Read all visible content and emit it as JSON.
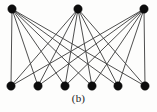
{
  "figure": {
    "caption": "(b)",
    "background_color": "#fdfdfc",
    "node_color": "#0d0d0d",
    "edge_color": "#3b3b3b",
    "node_radius": 4.2,
    "edge_width": 0.9
  },
  "chart_data": {
    "type": "diagram",
    "diagram_type": "complete-bipartite-graph",
    "title": "(b)",
    "notation": "K(3,6)",
    "node_count": 9,
    "edge_count": 18,
    "partitions": [
      {
        "name": "top",
        "count": 3,
        "nodes": [
          {
            "id": "t1",
            "label": "",
            "x": 12,
            "y": 9
          },
          {
            "id": "t2",
            "label": "",
            "x": 78,
            "y": 9
          },
          {
            "id": "t3",
            "label": "",
            "x": 144,
            "y": 9
          }
        ]
      },
      {
        "name": "bottom",
        "count": 6,
        "nodes": [
          {
            "id": "b1",
            "label": "",
            "x": 11,
            "y": 86
          },
          {
            "id": "b2",
            "label": "",
            "x": 38,
            "y": 86
          },
          {
            "id": "b3",
            "label": "",
            "x": 65,
            "y": 86
          },
          {
            "id": "b4",
            "label": "",
            "x": 92,
            "y": 86
          },
          {
            "id": "b5",
            "label": "",
            "x": 118,
            "y": 86
          },
          {
            "id": "b6",
            "label": "",
            "x": 145,
            "y": 86
          }
        ]
      }
    ],
    "edges": [
      {
        "from": "t1",
        "to": "b1"
      },
      {
        "from": "t1",
        "to": "b2"
      },
      {
        "from": "t1",
        "to": "b3"
      },
      {
        "from": "t1",
        "to": "b4"
      },
      {
        "from": "t1",
        "to": "b5"
      },
      {
        "from": "t1",
        "to": "b6"
      },
      {
        "from": "t2",
        "to": "b1"
      },
      {
        "from": "t2",
        "to": "b2"
      },
      {
        "from": "t2",
        "to": "b3"
      },
      {
        "from": "t2",
        "to": "b4"
      },
      {
        "from": "t2",
        "to": "b5"
      },
      {
        "from": "t2",
        "to": "b6"
      },
      {
        "from": "t3",
        "to": "b1"
      },
      {
        "from": "t3",
        "to": "b2"
      },
      {
        "from": "t3",
        "to": "b3"
      },
      {
        "from": "t3",
        "to": "b4"
      },
      {
        "from": "t3",
        "to": "b5"
      },
      {
        "from": "t3",
        "to": "b6"
      }
    ]
  }
}
